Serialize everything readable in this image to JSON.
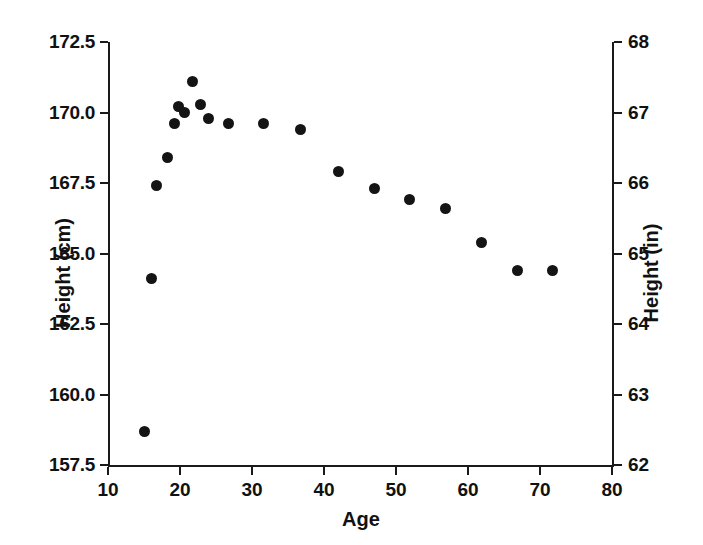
{
  "chart_data": {
    "type": "scatter",
    "title": "",
    "xlabel": "Age",
    "ylabel": "Height (cm)",
    "ylabel_secondary": "Height (in)",
    "xlim": [
      10,
      80
    ],
    "ylim": [
      157.5,
      172.5
    ],
    "ylim_secondary": [
      62,
      68
    ],
    "grid": false,
    "legend": null,
    "marker": {
      "shape": "circle",
      "color": "#141414",
      "size": 11
    },
    "xticks": [
      10,
      20,
      30,
      40,
      50,
      60,
      70,
      80
    ],
    "xticklabels": [
      "10",
      "20",
      "30",
      "40",
      "50",
      "60",
      "70",
      "80"
    ],
    "yticks": [
      157.5,
      160.0,
      162.5,
      165.0,
      167.5,
      170.0,
      172.5
    ],
    "yticklabels": [
      "157.5",
      "160.0",
      "162.5",
      "165.0",
      "167.5",
      "170.0",
      "172.5"
    ],
    "yticks_secondary": [
      62,
      63,
      64,
      65,
      66,
      67,
      68
    ],
    "yticklabels_secondary": [
      "62",
      "63",
      "64",
      "65",
      "66",
      "67",
      "68"
    ],
    "series": [
      {
        "name": "Height by age",
        "points": [
          {
            "x": 15.0,
            "y": 158.7
          },
          {
            "x": 16.1,
            "y": 164.1
          },
          {
            "x": 16.8,
            "y": 167.4
          },
          {
            "x": 18.2,
            "y": 168.4
          },
          {
            "x": 19.2,
            "y": 169.6
          },
          {
            "x": 19.8,
            "y": 170.2
          },
          {
            "x": 20.6,
            "y": 170.0
          },
          {
            "x": 21.8,
            "y": 171.1
          },
          {
            "x": 22.8,
            "y": 170.3
          },
          {
            "x": 23.9,
            "y": 169.8
          },
          {
            "x": 26.8,
            "y": 169.6
          },
          {
            "x": 31.6,
            "y": 169.6
          },
          {
            "x": 36.8,
            "y": 169.4
          },
          {
            "x": 42.0,
            "y": 167.9
          },
          {
            "x": 47.0,
            "y": 167.3
          },
          {
            "x": 51.9,
            "y": 166.9
          },
          {
            "x": 56.9,
            "y": 166.6
          },
          {
            "x": 61.9,
            "y": 165.4
          },
          {
            "x": 66.9,
            "y": 164.4
          },
          {
            "x": 71.8,
            "y": 164.4
          }
        ]
      }
    ]
  }
}
